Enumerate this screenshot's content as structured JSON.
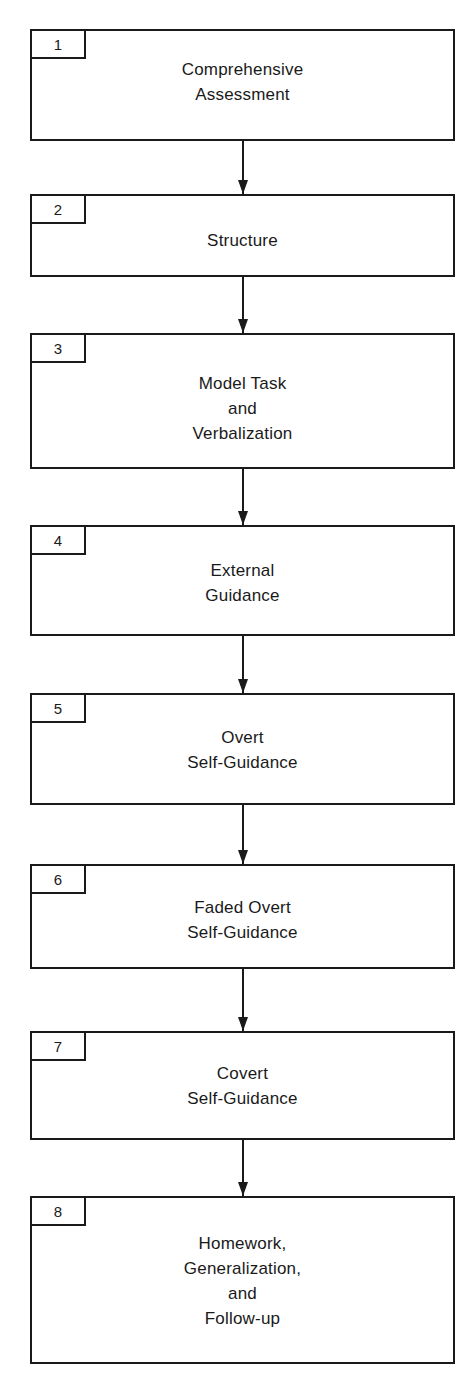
{
  "diagram": {
    "type": "vertical-flowchart",
    "steps": [
      {
        "number": "1",
        "lines": [
          "Comprehensive",
          "Assessment"
        ]
      },
      {
        "number": "2",
        "lines": [
          "Structure"
        ]
      },
      {
        "number": "3",
        "lines": [
          "Model Task",
          "and",
          "Verbalization"
        ]
      },
      {
        "number": "4",
        "lines": [
          "External",
          "Guidance"
        ]
      },
      {
        "number": "5",
        "lines": [
          "Overt",
          "Self-Guidance"
        ]
      },
      {
        "number": "6",
        "lines": [
          "Faded Overt",
          "Self-Guidance"
        ]
      },
      {
        "number": "7",
        "lines": [
          "Covert",
          "Self-Guidance"
        ]
      },
      {
        "number": "8",
        "lines": [
          "Homework,",
          "Generalization,",
          "and",
          "Follow-up"
        ]
      }
    ],
    "connections": [
      {
        "from": "1",
        "to": "2"
      },
      {
        "from": "2",
        "to": "3"
      },
      {
        "from": "3",
        "to": "4"
      },
      {
        "from": "4",
        "to": "5"
      },
      {
        "from": "5",
        "to": "6"
      },
      {
        "from": "6",
        "to": "7"
      },
      {
        "from": "7",
        "to": "8"
      }
    ],
    "colors": {
      "stroke": "#1a1a1a",
      "background": "#ffffff",
      "text": "#1a1a1a"
    }
  }
}
